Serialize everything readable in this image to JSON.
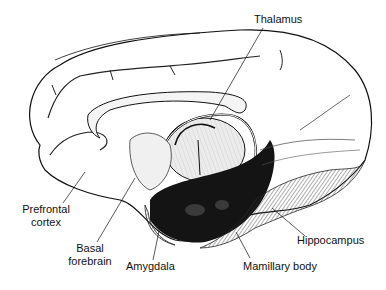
{
  "figure": {
    "labels": {
      "thalamus": "Thalamus",
      "prefrontal_line1": "Prefrontal",
      "prefrontal_line2": "cortex",
      "basal_line1": "Basal",
      "basal_line2": "forebrain",
      "amygdala": "Amygdala",
      "mamillary": "Mamillary body",
      "hippocampus": "Hippocampus"
    },
    "colors": {
      "ink": "#111111",
      "background": "#ffffff",
      "shading_dark": "#1a1a1a",
      "shading_mid": "#6a6a6a"
    }
  }
}
